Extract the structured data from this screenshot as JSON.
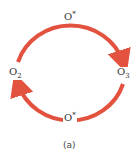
{
  "diagram": {
    "nodes": {
      "left": {
        "base": "O",
        "sub": "2"
      },
      "right": {
        "base": "O",
        "sub": "3"
      }
    },
    "arcs": {
      "top": {
        "base": "O",
        "sup": "*",
        "direction": "O2 to O3 (clockwise)"
      },
      "bottom": {
        "base": "O",
        "sup": "*",
        "direction": "O3 to O2 (clockwise)"
      }
    },
    "caption": "(a)",
    "arrow_color": "#e2523e"
  }
}
